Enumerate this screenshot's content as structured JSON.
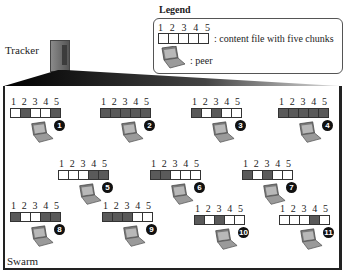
{
  "legend": {
    "title": "Legend",
    "chunk_numbers": [
      "1",
      "2",
      "3",
      "4",
      "5"
    ],
    "file_label": ": content file with five chunks",
    "peer_label": ": peer"
  },
  "tracker": {
    "label": "Tracker"
  },
  "swarm": {
    "label": "Swarm",
    "chunk_numbers": [
      "1",
      "2",
      "3",
      "4",
      "5"
    ],
    "peers": [
      {
        "id": "1",
        "chunks": [
          0,
          1,
          0,
          0,
          1
        ],
        "x": 10,
        "y": 97
      },
      {
        "id": "2",
        "chunks": [
          1,
          1,
          1,
          1,
          1
        ],
        "x": 100,
        "y": 97
      },
      {
        "id": "3",
        "chunks": [
          1,
          0,
          1,
          0,
          0
        ],
        "x": 191,
        "y": 97
      },
      {
        "id": "4",
        "chunks": [
          1,
          1,
          1,
          1,
          1
        ],
        "x": 278,
        "y": 97
      },
      {
        "id": "5",
        "chunks": [
          0,
          0,
          0,
          1,
          1
        ],
        "x": 58,
        "y": 159
      },
      {
        "id": "6",
        "chunks": [
          1,
          1,
          0,
          0,
          0
        ],
        "x": 150,
        "y": 159
      },
      {
        "id": "7",
        "chunks": [
          1,
          0,
          1,
          0,
          0
        ],
        "x": 242,
        "y": 159
      },
      {
        "id": "8",
        "chunks": [
          1,
          0,
          0,
          1,
          1
        ],
        "x": 10,
        "y": 201
      },
      {
        "id": "9",
        "chunks": [
          1,
          1,
          1,
          0,
          0
        ],
        "x": 102,
        "y": 201
      },
      {
        "id": "10",
        "chunks": [
          1,
          0,
          1,
          0,
          0
        ],
        "x": 194,
        "y": 204
      },
      {
        "id": "11",
        "chunks": [
          0,
          0,
          0,
          1,
          0
        ],
        "x": 279,
        "y": 204
      }
    ]
  },
  "colors": {
    "chunk_filled": "#5a5a5a",
    "chunk_empty": "#ffffff",
    "badge": "#111111"
  }
}
